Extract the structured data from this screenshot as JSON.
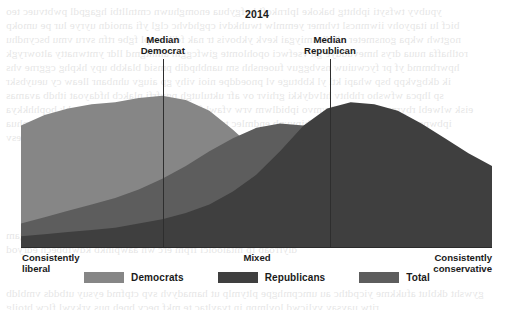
{
  "chart": {
    "title": "2014",
    "axis": {
      "left_label_line1": "Consistently",
      "left_label_line2": "liberal",
      "mid_label": "Mixed",
      "right_label_line1": "Consistently",
      "right_label_line2": "conservative"
    },
    "annotations": [
      {
        "name": "median-democrat",
        "line1": "Median",
        "line2": "Democrat",
        "x_pct": 30.1
      },
      {
        "name": "median-republican",
        "line1": "Median",
        "line2": "Republican",
        "x_pct": 65.6
      }
    ],
    "legend": [
      {
        "label": "Democrats",
        "color": "#868686"
      },
      {
        "label": "Republicans",
        "color": "#3f3f3f"
      },
      {
        "label": "Total",
        "color": "#5d5d5d"
      }
    ]
  },
  "chart_data": {
    "type": "area",
    "title": "2014",
    "subtitle": "",
    "xlabel": "Ideological consistency",
    "ylabel": "Share of respondents",
    "grid": false,
    "legend_position": "bottom-center",
    "xlim": [
      0,
      100
    ],
    "ylim": [
      0,
      100
    ],
    "x_tick_labels": [
      "Consistently liberal",
      "Mixed",
      "Consistently conservative"
    ],
    "x_tick_positions": [
      0,
      50,
      100
    ],
    "annotations": [
      {
        "label": "Median Democrat",
        "x": 30.1
      },
      {
        "label": "Median Republican",
        "x": 65.6
      }
    ],
    "colors": {
      "democrats": "#868686",
      "republicans": "#3f3f3f",
      "total": "#5d5d5d",
      "axis": "#2b2b2b",
      "background": "#ffffff"
    },
    "x": [
      0,
      5,
      10,
      15,
      20,
      25,
      30,
      35,
      40,
      45,
      50,
      55,
      60,
      65,
      70,
      75,
      80,
      85,
      90,
      95,
      100
    ],
    "series": [
      {
        "name": "Democrats",
        "color": "#868686",
        "values": [
          57,
          62,
          65,
          67,
          68,
          70,
          71,
          69,
          64,
          55,
          45,
          36,
          29,
          24,
          20,
          16,
          13,
          10,
          8,
          6,
          5
        ]
      },
      {
        "name": "Republicans",
        "color": "#3f3f3f",
        "values": [
          5,
          6,
          7,
          8,
          9,
          11,
          13,
          16,
          20,
          26,
          34,
          45,
          57,
          65,
          68,
          67,
          64,
          58,
          51,
          44,
          38
        ]
      },
      {
        "name": "Total",
        "color": "#5d5d5d",
        "values": [
          11,
          14,
          17,
          20,
          23,
          27,
          32,
          38,
          45,
          51,
          56,
          58,
          57,
          54,
          50,
          45,
          39,
          33,
          27,
          22,
          18
        ]
      }
    ]
  }
}
